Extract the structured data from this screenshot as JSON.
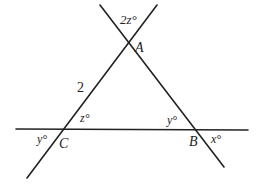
{
  "diagram": {
    "type": "geometry-figure",
    "points": {
      "A": {
        "label": "A",
        "x": 130,
        "y": 43
      },
      "B": {
        "label": "B",
        "x": 196,
        "y": 130
      },
      "C": {
        "label": "C",
        "x": 64,
        "y": 129
      }
    },
    "lines": [
      {
        "id": "line-ac",
        "x1": 157,
        "y1": 5,
        "x2": 27,
        "y2": 178
      },
      {
        "id": "line-ab",
        "x1": 100,
        "y1": 5,
        "x2": 224,
        "y2": 167
      },
      {
        "id": "line-cb",
        "x1": 16,
        "y1": 129,
        "x2": 248,
        "y2": 130
      }
    ],
    "labels": {
      "vertex_a": "A",
      "vertex_b": "B",
      "vertex_c": "C",
      "side_ac_length": "2",
      "angle_top_at_a": "2z°",
      "angle_inside_at_c": "z°",
      "angle_outside_at_c": "y°",
      "angle_inside_at_b": "y°",
      "angle_outside_at_b": "x°"
    },
    "colors": {
      "stroke": "#222222",
      "background": "#ffffff"
    }
  }
}
